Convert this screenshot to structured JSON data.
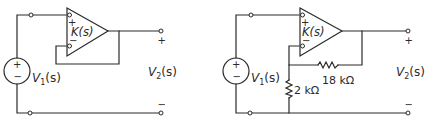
{
  "diagram": {
    "type": "circuit",
    "background": "#ffffff",
    "line_color": "#2a2a2a",
    "circuits": [
      {
        "id": "left",
        "description": "Unity-gain voltage follower",
        "source_label": "V",
        "source_sub": "1",
        "source_arg": "(s)",
        "source_plus": "+",
        "source_minus": "−",
        "opamp_label": "K(s)",
        "opamp_plus": "+",
        "opamp_minus": "−",
        "output_label": "V",
        "output_sub": "2",
        "output_arg": "(s)",
        "output_plus": "+",
        "output_minus": "−"
      },
      {
        "id": "right",
        "description": "Non-inverting amplifier with resistive feedback",
        "source_label": "V",
        "source_sub": "1",
        "source_arg": "(s)",
        "source_plus": "+",
        "source_minus": "−",
        "opamp_label": "K(s)",
        "opamp_plus": "+",
        "opamp_minus": "−",
        "feedback_resistor": "18 kΩ",
        "ground_resistor": "2 kΩ",
        "output_label": "V",
        "output_sub": "2",
        "output_arg": "(s)",
        "output_plus": "+",
        "output_minus": "−"
      }
    ]
  }
}
